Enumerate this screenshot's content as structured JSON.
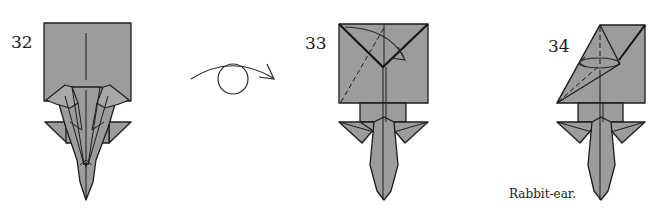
{
  "diagram": {
    "steps": [
      {
        "number": "32",
        "caption": ""
      },
      {
        "number": "33",
        "caption": ""
      },
      {
        "number": "34",
        "caption": "Rabbit-ear."
      }
    ],
    "transition_symbol": "turn-over",
    "colors": {
      "paper_fill": "#9c9c9c",
      "line": "#1c1c1c",
      "background": "#ffffff"
    }
  }
}
